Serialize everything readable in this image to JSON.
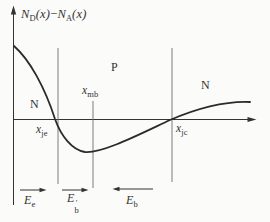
{
  "figure": {
    "type": "semiconductor-doping-profile-diagram",
    "colors": {
      "ink": "#333333",
      "curve": "#2b2b2b",
      "boundary_line": "#6e6e6e",
      "background": "#fbfbfa"
    },
    "y_axis": {
      "term1": {
        "base": "N",
        "sub": "D",
        "arg": "(x)"
      },
      "operator": "−",
      "term2": {
        "base": "N",
        "sub": "A",
        "arg": "(x)"
      }
    },
    "regions": [
      {
        "label": "N",
        "position": "left-of-first-junction"
      },
      {
        "label": "P",
        "position": "middle-base-region"
      },
      {
        "label": "N",
        "position": "right-of-second-junction"
      }
    ],
    "x_points": [
      {
        "base": "x",
        "sub": "je"
      },
      {
        "base": "x",
        "sub": "mb"
      },
      {
        "base": "x",
        "sub": "jc"
      }
    ],
    "field_arrows": [
      {
        "base": "E",
        "sub": "e",
        "prime": "",
        "direction": "right"
      },
      {
        "base": "E",
        "sub": "b",
        "prime": "′",
        "direction": "right"
      },
      {
        "base": "E",
        "sub": "b",
        "prime": "",
        "direction": "left"
      }
    ],
    "curve": {
      "description": "net doping N_D(x) - N_A(x) vs x",
      "zero_crossings": [
        "x_je",
        "x_jc"
      ],
      "minimum_near": "x_mb",
      "sign_regions": [
        "positive (N)",
        "negative (P)",
        "positive (N)"
      ]
    }
  }
}
